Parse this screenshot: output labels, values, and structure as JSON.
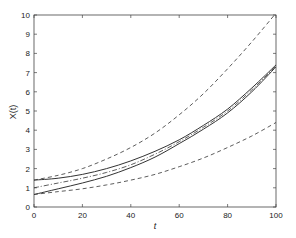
{
  "chart_data": {
    "type": "line",
    "title": "",
    "xlabel": "t",
    "ylabel": "X(t)",
    "xlim": [
      0,
      100
    ],
    "ylim": [
      0,
      10
    ],
    "xticks": [
      0,
      20,
      40,
      60,
      80,
      100
    ],
    "yticks": [
      0,
      1,
      2,
      3,
      4,
      5,
      6,
      7,
      8,
      9,
      10
    ],
    "grid": false,
    "legend": null,
    "x": [
      0,
      10,
      20,
      30,
      40,
      50,
      60,
      70,
      80,
      90,
      100
    ],
    "series": [
      {
        "name": "upper-bound",
        "style": "dashed",
        "values": [
          1.4,
          1.65,
          2.0,
          2.5,
          3.1,
          3.85,
          4.8,
          5.9,
          7.2,
          8.6,
          10.1
        ]
      },
      {
        "name": "upper-solid",
        "style": "solid",
        "values": [
          1.4,
          1.5,
          1.7,
          2.0,
          2.4,
          2.9,
          3.5,
          4.25,
          5.1,
          6.2,
          7.4
        ]
      },
      {
        "name": "mean",
        "style": "dashdot",
        "values": [
          1.0,
          1.25,
          1.5,
          1.8,
          2.2,
          2.75,
          3.4,
          4.15,
          5.0,
          6.1,
          7.35
        ]
      },
      {
        "name": "lower-solid",
        "style": "solid",
        "values": [
          0.65,
          0.95,
          1.25,
          1.6,
          2.05,
          2.6,
          3.3,
          4.05,
          4.9,
          6.0,
          7.3
        ]
      },
      {
        "name": "lower-bound",
        "style": "dashed",
        "values": [
          0.65,
          0.8,
          0.95,
          1.15,
          1.4,
          1.7,
          2.1,
          2.55,
          3.1,
          3.7,
          4.4
        ]
      }
    ]
  },
  "axes": {
    "xlabel": "t",
    "ylabel": "X(t)"
  }
}
